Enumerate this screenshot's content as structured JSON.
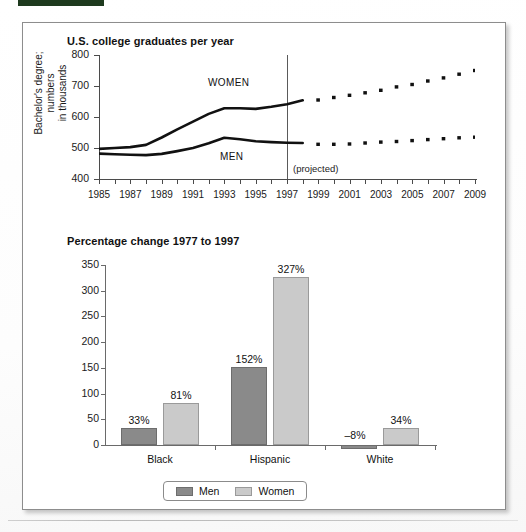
{
  "page": {
    "top_bar_color": "#1e3a1e",
    "panel_bg": "#ffffff"
  },
  "line_chart": {
    "title": "U.S. college graduates per year",
    "ylabel_line1": "Bachelor's degree; numbers",
    "ylabel_line2": "in thousands",
    "projected_note": "(projected)",
    "series_labels": {
      "women": "WOMEN",
      "men": "MEN"
    }
  },
  "bar_chart": {
    "title": "Percentage change 1977 to 1997",
    "legend": [
      {
        "label": "Men",
        "color": "#8a8a8a"
      },
      {
        "label": "Women",
        "color": "#cacaca"
      }
    ]
  },
  "chart_data": [
    {
      "type": "line",
      "title": "U.S. college graduates per year",
      "xlabel": "",
      "ylabel": "Bachelor's degree; numbers in thousands",
      "ylim": [
        400,
        800
      ],
      "ytick_labels": [
        "400",
        "500",
        "600",
        "700",
        "800"
      ],
      "xlim": [
        1985,
        2009
      ],
      "xtick_labels": [
        "1985",
        "1987",
        "1989",
        "1991",
        "1993",
        "1995",
        "1997",
        "1999",
        "2001",
        "2003",
        "2005",
        "2007",
        "2009"
      ],
      "grid": false,
      "legend_position": "inline-annotation",
      "annotations": [
        "WOMEN",
        "MEN",
        "(projected)"
      ],
      "projection_starts": 1998,
      "x": [
        1985,
        1986,
        1987,
        1988,
        1989,
        1990,
        1991,
        1992,
        1993,
        1994,
        1995,
        1996,
        1997,
        1998,
        1999,
        2000,
        2001,
        2002,
        2003,
        2004,
        2005,
        2006,
        2007,
        2008,
        2009
      ],
      "series": [
        {
          "name": "WOMEN",
          "style_actual": "solid",
          "style_projected": "dotted",
          "values": [
            497,
            500,
            503,
            510,
            534,
            560,
            585,
            610,
            628,
            628,
            626,
            633,
            641,
            654,
            655,
            663,
            670,
            678,
            686,
            697,
            705,
            716,
            726,
            738,
            750
          ]
        },
        {
          "name": "MEN",
          "style_actual": "solid",
          "style_projected": "dotted",
          "values": [
            482,
            480,
            478,
            477,
            481,
            490,
            500,
            515,
            533,
            528,
            522,
            519,
            517,
            516,
            512,
            512,
            513,
            516,
            519,
            521,
            524,
            527,
            530,
            533,
            535
          ]
        }
      ]
    },
    {
      "type": "bar",
      "title": "Percentage change 1977 to 1997",
      "xlabel": "",
      "ylabel": "",
      "ylim": [
        0,
        350
      ],
      "ytick_labels": [
        "0",
        "50",
        "100",
        "150",
        "200",
        "250",
        "300",
        "350"
      ],
      "grid": false,
      "legend_position": "bottom-center",
      "broken_axis_note": "Hispanic Women bar is drawn with an axis break (zigzag) between ~255 and ~275",
      "categories": [
        "Black",
        "Hispanic",
        "White"
      ],
      "series": [
        {
          "name": "Men",
          "color": "#8a8a8a",
          "values": [
            33,
            152,
            -8
          ],
          "labels": [
            "33%",
            "152%",
            "–8%"
          ]
        },
        {
          "name": "Women",
          "color": "#cacaca",
          "values": [
            81,
            327,
            34
          ],
          "labels": [
            "81%",
            "327%",
            "34%"
          ]
        }
      ]
    }
  ]
}
